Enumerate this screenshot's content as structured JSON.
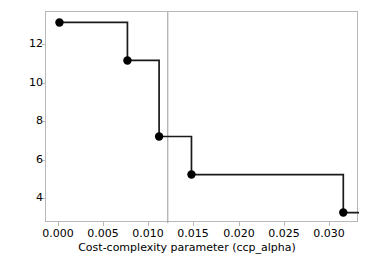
{
  "chart_data": {
    "type": "line",
    "subtype": "step-post",
    "title": "",
    "xlabel": "Cost-complexity parameter (ccp_alpha)",
    "ylabel": "Number of nodes",
    "xlim": [
      -0.0015,
      0.0334
    ],
    "ylim": [
      2.45,
      13.55
    ],
    "xticks": [
      0.0,
      0.005,
      0.01,
      0.015,
      0.02,
      0.025,
      0.03
    ],
    "xticklabels": [
      "0.000",
      "0.005",
      "0.010",
      "0.015",
      "0.020",
      "0.025",
      "0.030"
    ],
    "yticks": [
      12,
      10,
      8,
      6,
      4
    ],
    "yticklabels": [
      "12",
      "10",
      "8",
      "6",
      "4"
    ],
    "grid": false,
    "legend": null,
    "marker": "o",
    "drawstyle": "steps-post",
    "line_color": "#1a1a1a",
    "marker_color": "#000000",
    "series": [
      {
        "name": "number of nodes vs ccp_alpha",
        "x": [
          0.0,
          0.00758,
          0.01111,
          0.01472,
          0.03165
        ],
        "y": [
          13,
          11,
          7,
          5,
          3
        ]
      }
    ],
    "annotations": [
      {
        "kind": "vertical-reference-line",
        "x": 0.01208,
        "color": "#9a9a9a",
        "linewidth": 1
      }
    ]
  },
  "axis": {
    "frame_color": "#b8b8b8",
    "background": "#ffffff"
  }
}
